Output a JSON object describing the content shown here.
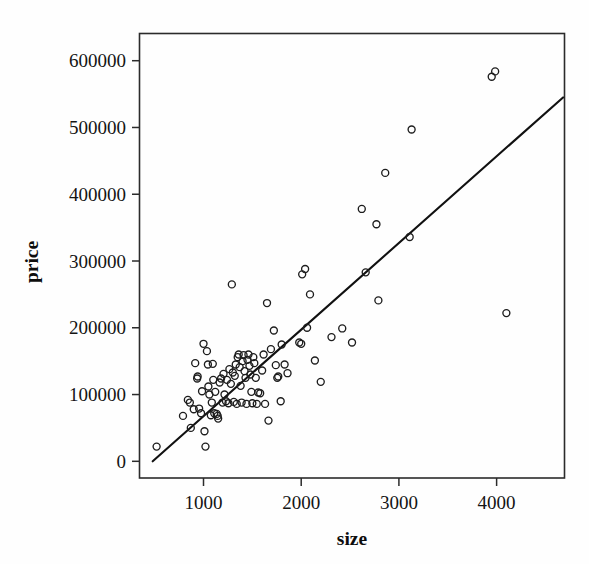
{
  "chart_data": {
    "type": "scatter",
    "title": "",
    "xlabel": "size",
    "ylabel": "price",
    "xlim": [
      350,
      4700
    ],
    "ylim": [
      -25000,
      640000
    ],
    "grid": false,
    "legend": null,
    "x_ticks": [
      1000,
      2000,
      3000,
      4000
    ],
    "x_tick_labels": [
      "1000",
      "2000",
      "3000",
      "4000"
    ],
    "y_ticks": [
      0,
      100000,
      200000,
      300000,
      400000,
      500000,
      600000
    ],
    "y_tick_labels": [
      "0",
      "100000",
      "200000",
      "300000",
      "400000",
      "500000",
      "600000"
    ],
    "marker": "open-circle",
    "marker_color": "#1d1d1d",
    "points": [
      {
        "x": 520,
        "y": 22000
      },
      {
        "x": 790,
        "y": 68000
      },
      {
        "x": 840,
        "y": 92000
      },
      {
        "x": 860,
        "y": 88000
      },
      {
        "x": 870,
        "y": 50000
      },
      {
        "x": 900,
        "y": 78000
      },
      {
        "x": 915,
        "y": 147000
      },
      {
        "x": 935,
        "y": 124000
      },
      {
        "x": 940,
        "y": 127000
      },
      {
        "x": 955,
        "y": 79000
      },
      {
        "x": 975,
        "y": 72000
      },
      {
        "x": 985,
        "y": 105000
      },
      {
        "x": 1000,
        "y": 176000
      },
      {
        "x": 1010,
        "y": 45000
      },
      {
        "x": 1020,
        "y": 22000
      },
      {
        "x": 1035,
        "y": 165000
      },
      {
        "x": 1045,
        "y": 145000
      },
      {
        "x": 1050,
        "y": 112000
      },
      {
        "x": 1060,
        "y": 100000
      },
      {
        "x": 1075,
        "y": 69000
      },
      {
        "x": 1085,
        "y": 88000
      },
      {
        "x": 1095,
        "y": 146000
      },
      {
        "x": 1100,
        "y": 122000
      },
      {
        "x": 1110,
        "y": 72000
      },
      {
        "x": 1120,
        "y": 104000
      },
      {
        "x": 1135,
        "y": 71000
      },
      {
        "x": 1145,
        "y": 68000
      },
      {
        "x": 1150,
        "y": 64000
      },
      {
        "x": 1165,
        "y": 118000
      },
      {
        "x": 1180,
        "y": 124000
      },
      {
        "x": 1195,
        "y": 88000
      },
      {
        "x": 1205,
        "y": 131000
      },
      {
        "x": 1215,
        "y": 100000
      },
      {
        "x": 1230,
        "y": 90000
      },
      {
        "x": 1240,
        "y": 122000
      },
      {
        "x": 1255,
        "y": 87000
      },
      {
        "x": 1265,
        "y": 138000
      },
      {
        "x": 1280,
        "y": 116000
      },
      {
        "x": 1290,
        "y": 265000
      },
      {
        "x": 1300,
        "y": 133000
      },
      {
        "x": 1310,
        "y": 89000
      },
      {
        "x": 1320,
        "y": 128000
      },
      {
        "x": 1330,
        "y": 145000
      },
      {
        "x": 1340,
        "y": 86000
      },
      {
        "x": 1350,
        "y": 156000
      },
      {
        "x": 1360,
        "y": 160000
      },
      {
        "x": 1370,
        "y": 141000
      },
      {
        "x": 1380,
        "y": 113000
      },
      {
        "x": 1390,
        "y": 88000
      },
      {
        "x": 1400,
        "y": 150000
      },
      {
        "x": 1410,
        "y": 159000
      },
      {
        "x": 1420,
        "y": 135000
      },
      {
        "x": 1430,
        "y": 125000
      },
      {
        "x": 1440,
        "y": 86000
      },
      {
        "x": 1450,
        "y": 152000
      },
      {
        "x": 1460,
        "y": 160000
      },
      {
        "x": 1470,
        "y": 143000
      },
      {
        "x": 1480,
        "y": 130000
      },
      {
        "x": 1490,
        "y": 104000
      },
      {
        "x": 1500,
        "y": 87000
      },
      {
        "x": 1510,
        "y": 156000
      },
      {
        "x": 1520,
        "y": 147000
      },
      {
        "x": 1535,
        "y": 125000
      },
      {
        "x": 1545,
        "y": 86000
      },
      {
        "x": 1560,
        "y": 103000
      },
      {
        "x": 1580,
        "y": 102000
      },
      {
        "x": 1600,
        "y": 136000
      },
      {
        "x": 1615,
        "y": 160000
      },
      {
        "x": 1630,
        "y": 86000
      },
      {
        "x": 1650,
        "y": 237000
      },
      {
        "x": 1665,
        "y": 61000
      },
      {
        "x": 1690,
        "y": 168000
      },
      {
        "x": 1720,
        "y": 196000
      },
      {
        "x": 1740,
        "y": 144000
      },
      {
        "x": 1755,
        "y": 125000
      },
      {
        "x": 1765,
        "y": 127000
      },
      {
        "x": 1790,
        "y": 90000
      },
      {
        "x": 1800,
        "y": 175000
      },
      {
        "x": 1830,
        "y": 145000
      },
      {
        "x": 1860,
        "y": 132000
      },
      {
        "x": 1980,
        "y": 178000
      },
      {
        "x": 2000,
        "y": 176000
      },
      {
        "x": 2010,
        "y": 280000
      },
      {
        "x": 2040,
        "y": 288000
      },
      {
        "x": 2060,
        "y": 200000
      },
      {
        "x": 2090,
        "y": 250000
      },
      {
        "x": 2140,
        "y": 151000
      },
      {
        "x": 2200,
        "y": 119000
      },
      {
        "x": 2310,
        "y": 186000
      },
      {
        "x": 2420,
        "y": 199000
      },
      {
        "x": 2520,
        "y": 178000
      },
      {
        "x": 2620,
        "y": 378000
      },
      {
        "x": 2660,
        "y": 283000
      },
      {
        "x": 2770,
        "y": 355000
      },
      {
        "x": 2790,
        "y": 241000
      },
      {
        "x": 2860,
        "y": 432000
      },
      {
        "x": 3110,
        "y": 336000
      },
      {
        "x": 3130,
        "y": 497000
      },
      {
        "x": 3950,
        "y": 576000
      },
      {
        "x": 3985,
        "y": 584000
      },
      {
        "x": 4100,
        "y": 222000
      }
    ],
    "fit_line": {
      "visible": true,
      "color": "#111111",
      "x_start": 480,
      "y_start": 0,
      "x_end": 4680,
      "y_end": 545000
    }
  }
}
